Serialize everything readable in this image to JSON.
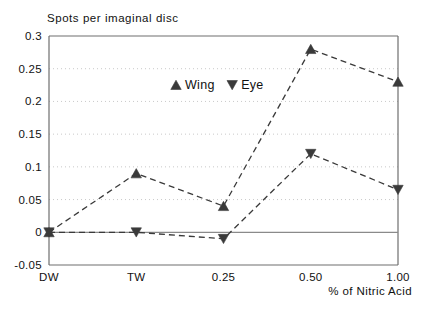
{
  "chart_data": {
    "type": "line",
    "title": "Spots per imaginal disc",
    "xlabel": "% of Nitric Acid",
    "ylabel": "",
    "categories": [
      "DW",
      "TW",
      "0.25",
      "0.50",
      "1.00"
    ],
    "series": [
      {
        "name": "Wing",
        "marker": "triangle-up",
        "values": [
          0,
          0.09,
          0.04,
          0.28,
          0.23
        ]
      },
      {
        "name": "Eye",
        "marker": "triangle-down",
        "values": [
          0,
          0.0,
          -0.01,
          0.12,
          0.065
        ]
      }
    ],
    "ylim": [
      -0.05,
      0.3
    ],
    "yticks": [
      "0.3",
      "0.25",
      "0.2",
      "0.15",
      "0.1",
      "0.05",
      "0",
      "-0.05"
    ],
    "ytick_values": [
      0.3,
      0.25,
      0.2,
      0.15,
      0.1,
      0.05,
      0,
      -0.05
    ],
    "grid": true,
    "grid_style": "dotted",
    "legend_position": "inside-top-center",
    "line_style": "dashed",
    "colors": {
      "series": "#3a3a3a",
      "grid": "#c9c9c9",
      "axis": "#6e6e6e",
      "zero_line": "#8a8a8a",
      "text": "#111111"
    }
  },
  "legend": {
    "entries": [
      {
        "label": "Wing",
        "marker": "triangle-up"
      },
      {
        "label": "Eye",
        "marker": "triangle-down"
      }
    ]
  }
}
